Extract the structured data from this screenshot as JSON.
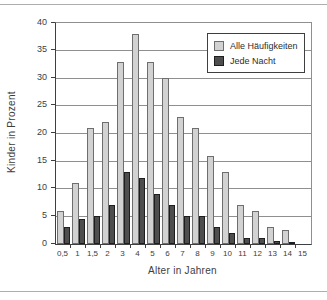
{
  "figure": {
    "background": "#ffffff",
    "rule_color": "#adadad"
  },
  "chart_data": {
    "type": "bar",
    "title": "",
    "xlabel": "Alter in Jahren",
    "ylabel": "Kinder in Prozent",
    "categories": [
      "0,5",
      "1",
      "1,5",
      "2",
      "3",
      "4",
      "5",
      "6",
      "7",
      "8",
      "9",
      "10",
      "11",
      "12",
      "13",
      "14",
      "15"
    ],
    "series": [
      {
        "name": "Alle Häufigkeiten",
        "fill": "#d2d2d2",
        "border": "#6e6e6e",
        "values": [
          6,
          11,
          21,
          22,
          33,
          38,
          33,
          30,
          23,
          21,
          16,
          13,
          7,
          6,
          3,
          2.5,
          0
        ]
      },
      {
        "name": "Jede Nacht",
        "fill": "#4e4e4e",
        "border": "#1e1e1e",
        "values": [
          3,
          4.5,
          5,
          7,
          13,
          12,
          9,
          7,
          5,
          5,
          3,
          2,
          1,
          1,
          0.5,
          0.3,
          0
        ]
      }
    ],
    "ylim": [
      0,
      40
    ],
    "ytick_step": 5,
    "yticks": [
      0,
      5,
      10,
      15,
      20,
      25,
      30,
      35,
      40
    ],
    "grid": "horizontal",
    "legend_position": "top-right",
    "grid_color": "#8f8f8f",
    "axis_color": "#3f3f3f"
  }
}
